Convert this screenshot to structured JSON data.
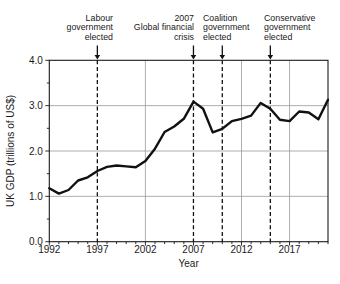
{
  "chart_data": {
    "type": "line",
    "title": "",
    "xlabel": "Year",
    "ylabel": "UK GDP (trillions of US$)",
    "x": [
      1992,
      1993,
      1994,
      1995,
      1996,
      1997,
      1998,
      1999,
      2000,
      2001,
      2002,
      2003,
      2004,
      2005,
      2006,
      2007,
      2008,
      2009,
      2010,
      2011,
      2012,
      2013,
      2014,
      2015,
      2016,
      2017,
      2018,
      2019,
      2020,
      2021
    ],
    "values": [
      1.18,
      1.06,
      1.14,
      1.35,
      1.42,
      1.56,
      1.65,
      1.68,
      1.66,
      1.64,
      1.78,
      2.05,
      2.42,
      2.54,
      2.71,
      3.09,
      2.93,
      2.41,
      2.49,
      2.66,
      2.71,
      2.78,
      3.06,
      2.93,
      2.69,
      2.66,
      2.87,
      2.85,
      2.7,
      3.13
    ],
    "xlim": [
      1992,
      2021
    ],
    "ylim": [
      0.0,
      4.0
    ],
    "x_major_ticks": [
      1992,
      1997,
      2002,
      2007,
      2012,
      2017
    ],
    "x_minor_step": 1,
    "y_major_ticks": [
      0,
      1,
      2,
      3,
      4
    ],
    "y_tick_labels": [
      "0.0",
      "1.0",
      "2.0",
      "3.0",
      "4.0"
    ],
    "y_minor_step": 0.5,
    "grid_horizontal_values": [
      1,
      2,
      3
    ],
    "grid_vertical_years": [
      2002,
      2012,
      2017
    ],
    "grid_on": true,
    "legend": "none",
    "line_color": "#111111",
    "grid_color": "#999999",
    "text_color": "#1a1a1a",
    "annotations": [
      {
        "id": "labour",
        "text": "Labour\ngovernment\nelected",
        "year": 1997,
        "align": "right"
      },
      {
        "id": "crisis",
        "text": "2007\nGlobal financial\ncrisis",
        "year": 2007,
        "align": "right"
      },
      {
        "id": "coalition",
        "text": "Coalition\ngovernment\nelected",
        "year": 2010,
        "align": "left"
      },
      {
        "id": "conservative",
        "text": "Conservative\ngovernment\nelected",
        "year": 2015,
        "align": "left"
      }
    ]
  }
}
